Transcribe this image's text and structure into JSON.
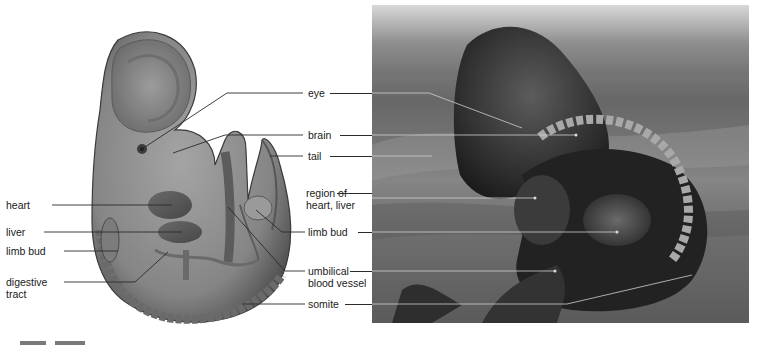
{
  "figure": {
    "left_labels": [
      {
        "id": "heart",
        "text": "heart"
      },
      {
        "id": "liver",
        "text": "liver"
      },
      {
        "id": "limb-bud",
        "text": "limb bud"
      },
      {
        "id": "digestive-tract",
        "line1": "digestive",
        "line2": "tract"
      }
    ],
    "center_labels": [
      {
        "id": "eye",
        "text": "eye"
      },
      {
        "id": "brain",
        "text": "brain"
      },
      {
        "id": "tail",
        "text": "tail"
      },
      {
        "id": "region-heart-liver",
        "line1": "region of",
        "line2": "heart, liver"
      },
      {
        "id": "limb-bud-2",
        "text": "limb bud"
      },
      {
        "id": "umbilical-blood-vessel",
        "line1": "umbilical",
        "line2": "blood vessel"
      },
      {
        "id": "somite",
        "text": "somite"
      }
    ],
    "colors": {
      "label_text": "#1a1a1a",
      "leader_line": "#2a2a2a",
      "embryo_fill": "#8a8a8a",
      "embryo_dark": "#4f4f4f",
      "photo_dark": "#1e1e1e"
    }
  }
}
